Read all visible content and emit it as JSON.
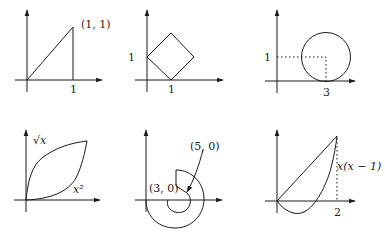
{
  "figure": {
    "panels": [
      {
        "id": "line-to-1-1",
        "labels": {
          "point": "(1, 1)",
          "x_tick": "1"
        }
      },
      {
        "id": "diamond",
        "labels": {
          "y_tick": "1",
          "x_tick": "1"
        }
      },
      {
        "id": "circle",
        "labels": {
          "y_tick": "1",
          "x_tick": "3"
        }
      },
      {
        "id": "sqrt-and-square",
        "labels": {
          "upper_curve": "√x",
          "lower_curve": "x²"
        }
      },
      {
        "id": "spiral",
        "labels": {
          "outer_point": "(5, 0)",
          "inner_point": "(3, 0)"
        }
      },
      {
        "id": "line-and-parabola",
        "labels": {
          "curve": "x(x − 1)",
          "x_tick": "2"
        }
      }
    ]
  }
}
